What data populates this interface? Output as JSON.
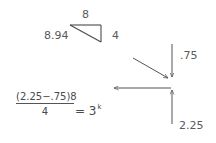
{
  "triangle": {
    "top_label": "8",
    "hypotenuse_label": "8.94",
    "right_label": "4"
  },
  "arrows": {
    "down_label": ".75",
    "up_label": "2.25"
  },
  "equation": {
    "numerator": "(2.25−.75)8",
    "denominator": "4",
    "equals": "= 3",
    "exponent": "k"
  },
  "colors": {
    "stroke": "#555555",
    "text": "#5a5a5a",
    "background": "#ffffff"
  }
}
